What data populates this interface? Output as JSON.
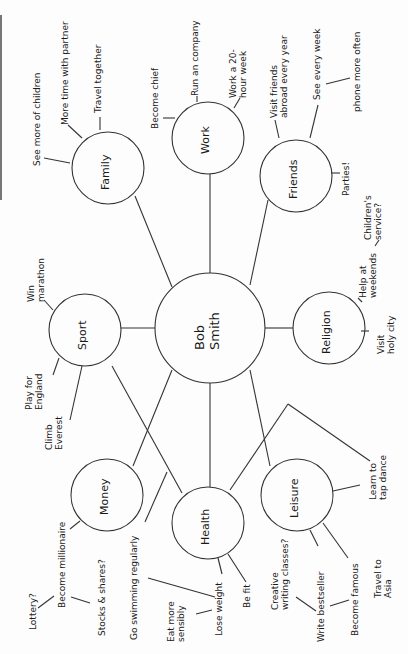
{
  "diagram": {
    "type": "mind-map",
    "center": {
      "label": "Bob\nSmith"
    },
    "branches": [
      {
        "id": "family",
        "label": "Family",
        "leaves": [
          "See more of children",
          "More time with partner",
          "Travel together"
        ]
      },
      {
        "id": "work",
        "label": "Work",
        "leaves": [
          "Become chief",
          "Run an company",
          "Work a 20-\nhour week"
        ]
      },
      {
        "id": "friends",
        "label": "Friends",
        "leaves": [
          "Visit friends\nabroad every year",
          "See every week",
          "phone more often",
          "Parties!"
        ]
      },
      {
        "id": "sport",
        "label": "Sport",
        "leaves": [
          "Win\nmarathon",
          "Play for\nEngland",
          "Climb\nEverest"
        ]
      },
      {
        "id": "religion",
        "label": "Religion",
        "leaves": [
          "Help at\nweekends",
          "Children's\nservice?",
          "Visit\nholy city"
        ]
      },
      {
        "id": "money",
        "label": "Money",
        "leaves": [
          "Become millionaire",
          "Lottery?",
          "Stocks & shares?"
        ]
      },
      {
        "id": "health",
        "label": "Health",
        "leaves": [
          "Go swimming regularly",
          "Lose weight",
          "Eat more\nsensibly",
          "Be fit"
        ]
      },
      {
        "id": "leisure",
        "label": "Leisure",
        "leaves": [
          "Learn to\ntap dance",
          "Write bestseller",
          "Creative\nwriting classes?",
          "Become famous",
          "Travel to\nAsia"
        ]
      }
    ]
  },
  "colors": {
    "ink": "#1a1a1a",
    "line": "#333333",
    "paper": "#fdfdfd",
    "border": "#777777"
  }
}
